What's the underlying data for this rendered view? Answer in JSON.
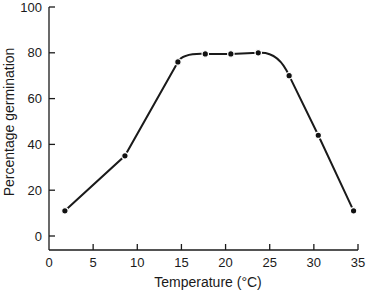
{
  "chart_data": {
    "type": "line",
    "title": "",
    "xlabel": "Temperature (°C)",
    "ylabel": "Percentage germination",
    "xlim": [
      0,
      35
    ],
    "ylim": [
      0,
      100
    ],
    "xticks": [
      0,
      5,
      10,
      15,
      20,
      25,
      30,
      35
    ],
    "yticks": [
      0,
      20,
      40,
      60,
      80,
      100
    ],
    "grid": false,
    "legend": null,
    "series": [
      {
        "name": "Germination",
        "x": [
          1.8,
          8.6,
          14.6,
          17.7,
          20.6,
          23.7,
          27.2,
          30.5,
          34.5
        ],
        "y": [
          11,
          35,
          76,
          79.5,
          79.5,
          80,
          70,
          44,
          11
        ]
      }
    ]
  }
}
